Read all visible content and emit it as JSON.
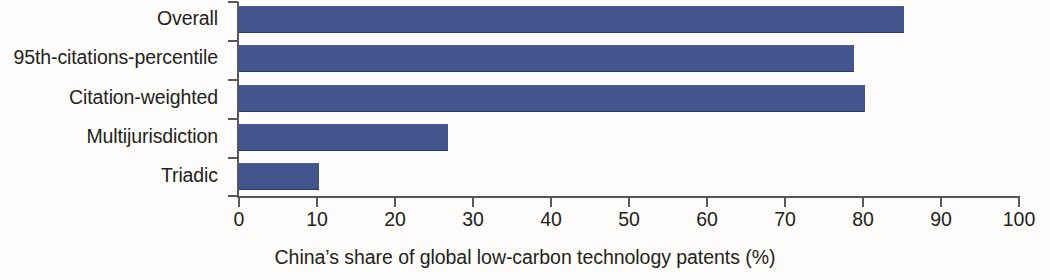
{
  "chart_data": {
    "type": "bar",
    "orientation": "horizontal",
    "title": "",
    "subtitle": "",
    "xlabel": "China’s share of global low-carbon technology patents (%)",
    "ylabel": "",
    "categories": [
      "Overall",
      "95th-citations-percentile",
      "Citation-weighted",
      "Multijurisdiction",
      "Triadic"
    ],
    "values": [
      84.3,
      78.0,
      79.4,
      26.6,
      10.3
    ],
    "xlim": [
      0,
      100
    ],
    "xticks": [
      0,
      10,
      20,
      30,
      40,
      50,
      60,
      70,
      80,
      90,
      100
    ],
    "xtick_labels": [
      "0",
      "10",
      "20",
      "30",
      "40",
      "50",
      "60",
      "70",
      "80",
      "90",
      "100"
    ],
    "grid": false,
    "legend": false,
    "legend_position": "none",
    "bar_color": "#42558c",
    "background_color": "#fdfcfa",
    "axis_color": "#58585a",
    "text_color": "#231f20"
  }
}
